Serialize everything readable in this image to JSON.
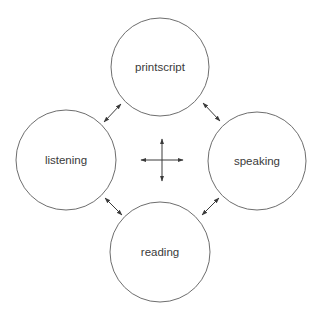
{
  "diagram": {
    "nodes": [
      {
        "id": "printscript",
        "label": "printscript",
        "cx": 160,
        "cy": 67,
        "r": 49
      },
      {
        "id": "listening",
        "label": "listening",
        "cx": 66,
        "cy": 160,
        "r": 50
      },
      {
        "id": "speaking",
        "label": "speaking",
        "cx": 257,
        "cy": 161,
        "r": 49
      },
      {
        "id": "reading",
        "label": "reading",
        "cx": 160,
        "cy": 252,
        "r": 50
      }
    ],
    "edges": [
      {
        "from": "listening",
        "to": "printscript",
        "bidirectional": true
      },
      {
        "from": "printscript",
        "to": "speaking",
        "bidirectional": true
      },
      {
        "from": "listening",
        "to": "reading",
        "bidirectional": true
      },
      {
        "from": "reading",
        "to": "speaking",
        "bidirectional": true
      }
    ],
    "center_symbol": "four-way-arrow",
    "colors": {
      "stroke": "#6e6e6e",
      "arrow": "#3a3a3a",
      "text": "#3a3a3a",
      "background": "#ffffff"
    }
  }
}
